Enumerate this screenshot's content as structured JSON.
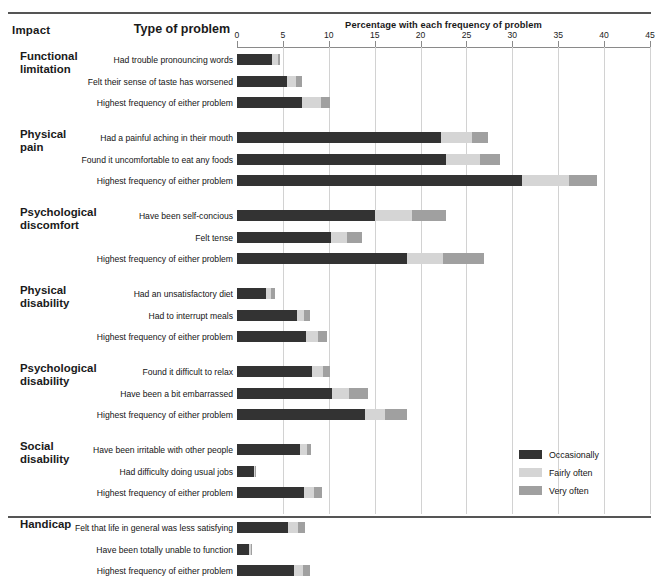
{
  "header": {
    "impact_label": "Impact",
    "type_label": "Type of problem",
    "axis_title": "Percentage with each frequency of problem"
  },
  "legend": {
    "position": "bottom-right",
    "items": [
      {
        "label": "Occasionally",
        "color": "#333333",
        "key": "occasionally"
      },
      {
        "label": "Fairly often",
        "color": "#d5d5d5",
        "key": "fairly_often"
      },
      {
        "label": "Very often",
        "color": "#a0a0a0",
        "key": "very_often"
      }
    ]
  },
  "chart_data": {
    "type": "bar",
    "orientation": "horizontal",
    "stacked": true,
    "title": "Percentage with each frequency of problem",
    "xlabel": "Percentage with each frequency of problem",
    "ylabel": "Type of problem",
    "xlim": [
      0,
      45
    ],
    "xticks": [
      0,
      5,
      10,
      15,
      20,
      25,
      30,
      35,
      40,
      45
    ],
    "xticklabels": [
      "0",
      "5",
      "10",
      "15",
      "20",
      "25",
      "30",
      "35",
      "40",
      "45"
    ],
    "grid": "vertical",
    "series": [
      {
        "name": "Occasionally",
        "color": "#333333"
      },
      {
        "name": "Fairly often",
        "color": "#d5d5d5"
      },
      {
        "name": "Very often",
        "color": "#a0a0a0"
      }
    ],
    "groups": [
      {
        "impact": "Functional limitation",
        "impact_line1": "Functional",
        "impact_line2": "limitation",
        "rows": [
          {
            "category": "Had trouble pronouncing words",
            "values": [
              3.8,
              0.7,
              0.2
            ]
          },
          {
            "category": "Felt their sense of taste has worsened",
            "values": [
              5.4,
              1.0,
              0.7
            ]
          },
          {
            "category": "Highest frequency of either problem",
            "values": [
              7.1,
              2.0,
              1.0
            ]
          }
        ]
      },
      {
        "impact": "Physical pain",
        "impact_line1": "Physical",
        "impact_line2": "pain",
        "rows": [
          {
            "category": "Had a painful aching in their mouth",
            "values": [
              22.2,
              3.4,
              1.7
            ]
          },
          {
            "category": "Found it uncomfortable to eat any foods",
            "values": [
              22.8,
              3.7,
              2.2
            ]
          },
          {
            "category": "Highest frequency of either problem",
            "values": [
              31.0,
              5.2,
              3.0
            ]
          }
        ]
      },
      {
        "impact": "Psychological discomfort",
        "impact_line1": "Psychological",
        "impact_line2": "discomfort",
        "rows": [
          {
            "category": "Have been self-concious",
            "values": [
              15.0,
              4.1,
              3.7
            ]
          },
          {
            "category": "Felt tense",
            "values": [
              10.2,
              1.8,
              1.6
            ]
          },
          {
            "category": "Highest frequency of either problem",
            "values": [
              18.5,
              3.9,
              4.5
            ]
          }
        ]
      },
      {
        "impact": "Physical disability",
        "impact_line1": "Physical",
        "impact_line2": "disability",
        "rows": [
          {
            "category": "Had an unsatisfactory diet",
            "values": [
              3.2,
              0.5,
              0.4
            ]
          },
          {
            "category": "Had to interrupt meals",
            "values": [
              6.5,
              0.8,
              0.7
            ]
          },
          {
            "category": "Highest frequency of either problem",
            "values": [
              7.5,
              1.3,
              1.0
            ]
          }
        ]
      },
      {
        "impact": "Psychological disability",
        "impact_line1": "Psychological",
        "impact_line2": "disability",
        "rows": [
          {
            "category": "Found it difficult to relax",
            "values": [
              8.2,
              1.2,
              0.7
            ]
          },
          {
            "category": "Have been a bit embarrassed",
            "values": [
              10.4,
              1.8,
              2.1
            ]
          },
          {
            "category": "Highest frequency of either problem",
            "values": [
              14.0,
              2.1,
              2.4
            ]
          }
        ]
      },
      {
        "impact": "Social disability",
        "impact_line1": "Social",
        "impact_line2": "disability",
        "rows": [
          {
            "category": "Have been irritable with other people",
            "values": [
              6.9,
              0.7,
              0.5
            ]
          },
          {
            "category": "Had difficulty doing usual jobs",
            "values": [
              1.8,
              0.2,
              0.1
            ]
          },
          {
            "category": "Highest frequency of either problem",
            "values": [
              7.3,
              1.1,
              0.9
            ]
          }
        ]
      },
      {
        "impact": "Handicap",
        "impact_line1": "Handicap",
        "impact_line2": "",
        "rows": [
          {
            "category": "Felt that life in general was less satisfying",
            "values": [
              5.6,
              1.0,
              0.8
            ]
          },
          {
            "category": "Have been totally unable to function",
            "values": [
              1.3,
              0.2,
              0.1
            ]
          },
          {
            "category": "Highest frequency of either problem",
            "values": [
              6.2,
              1.0,
              0.8
            ]
          }
        ]
      }
    ]
  }
}
